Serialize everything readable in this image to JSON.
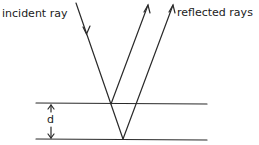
{
  "diagram": {
    "type": "thin-film-reflection",
    "labels": {
      "incident": "incident ray",
      "reflected": "reflected rays",
      "thickness": "d"
    },
    "colors": {
      "stroke": "#2a2a2a",
      "background": "#ffffff"
    },
    "geometry": {
      "top_surface": {
        "x1": 36,
        "y1": 103,
        "x2": 207,
        "y2": 104
      },
      "bottom_surface": {
        "x1": 36,
        "y1": 139,
        "x2": 207,
        "y2": 140
      },
      "incident_ray": {
        "x1": 76,
        "y1": 3,
        "x2": 123,
        "y2": 139
      },
      "reflected_ray_1": {
        "x1": 111,
        "y1": 104,
        "x2": 148,
        "y2": 5
      },
      "reflected_ray_2": {
        "x1": 123,
        "y1": 139,
        "x2": 173,
        "y2": 5
      },
      "d_arrow": {
        "x": 51,
        "y1": 104,
        "y2": 138
      }
    }
  }
}
